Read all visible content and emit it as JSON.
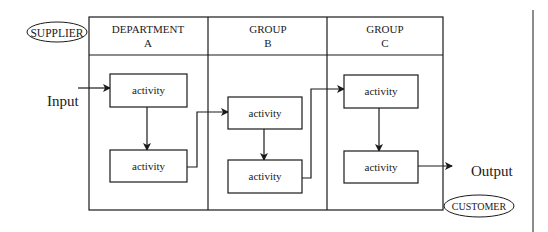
{
  "diagram": {
    "supplier_label": "SUPPLIER",
    "customer_label": "CUSTOMER",
    "input_label": "Input",
    "output_label": "Output",
    "columns": [
      {
        "line1": "DEPARTMENT",
        "line2": "A"
      },
      {
        "line1": "GROUP",
        "line2": "B"
      },
      {
        "line1": "GROUP",
        "line2": "C"
      }
    ],
    "activities": [
      {
        "label": "activity",
        "column": "A",
        "order": 1
      },
      {
        "label": "activity",
        "column": "A",
        "order": 2
      },
      {
        "label": "activity",
        "column": "B",
        "order": 1
      },
      {
        "label": "activity",
        "column": "B",
        "order": 2
      },
      {
        "label": "activity",
        "column": "C",
        "order": 1
      },
      {
        "label": "activity",
        "column": "C",
        "order": 2
      }
    ],
    "colors": {
      "line": "#1a1a1a",
      "background": "#ffffff"
    }
  }
}
